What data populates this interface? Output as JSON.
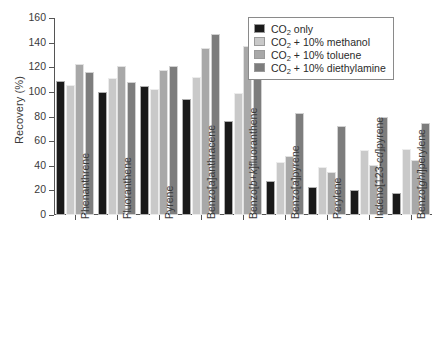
{
  "chart_data": {
    "type": "bar",
    "title": "",
    "xlabel": "",
    "ylabel": "Recovery (%)",
    "ylim": [
      0,
      160
    ],
    "yticks": [
      0,
      20,
      40,
      60,
      80,
      100,
      120,
      140,
      160
    ],
    "grid": false,
    "legend_position": "top-right",
    "categories": [
      "Phenanthrene",
      "Fluoranthene",
      "Pyrene",
      "Benzo[a]anthracene",
      "Benzo[b+k]fluoranthene",
      "Benzo[a]pyrene",
      "Perylene",
      "Indeno[123-cd]pyrene",
      "Benzo[ghi]perylene"
    ],
    "series": [
      {
        "name": "CO2 only",
        "label_html": "CO<sub>2</sub> only",
        "color": "#1a1a1a",
        "values": [
          109,
          100,
          105,
          94,
          76,
          28,
          23,
          20,
          18
        ]
      },
      {
        "name": "CO2 + 10% methanol",
        "label_html": "CO<sub>2</sub> + 10% methanol",
        "color": "#c9c9c9",
        "values": [
          106,
          111,
          102,
          112,
          99,
          43,
          39,
          53,
          54
        ]
      },
      {
        "name": "CO2 + 10% toluene",
        "label_html": "CO<sub>2</sub> + 10% toluene",
        "color": "#a8a8a8",
        "values": [
          123,
          121,
          118,
          136,
          137,
          48,
          35,
          41,
          45
        ]
      },
      {
        "name": "CO2 + 10% diethylamine",
        "label_html": "CO<sub>2</sub> + 10% diethylamine",
        "color": "#7d7d7d",
        "values": [
          116,
          108,
          121,
          147,
          153,
          83,
          72,
          80,
          75
        ]
      }
    ]
  },
  "axis": {
    "y_title": "Recovery (%)",
    "y_tick_labels": [
      "0",
      "20",
      "40",
      "60",
      "80",
      "100",
      "120",
      "140",
      "160"
    ]
  },
  "legend": {
    "entries": [
      "CO2 only",
      "CO2 + 10% methanol",
      "CO2 + 10% toluene",
      "CO2 + 10% diethylamine"
    ]
  },
  "colors": {
    "series_1": "#1a1a1a",
    "series_2": "#c9c9c9",
    "series_3": "#a8a8a8",
    "series_4": "#7d7d7d",
    "axis": "#555555",
    "text": "#3a3a3a",
    "background": "#ffffff"
  }
}
